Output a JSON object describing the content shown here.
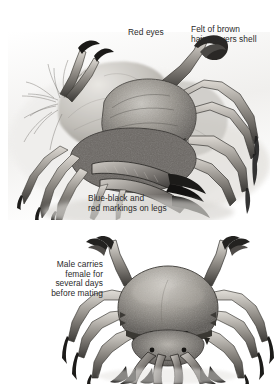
{
  "plate": {
    "title": "Velvet swimming crab anatomy and mating plate",
    "background_color": "#ffffff",
    "text_color": "#2b2b2b",
    "width": 278,
    "height": 385
  },
  "labels": {
    "red_eyes": "Red eyes",
    "felt_of_brown_hairs": "Felt of brown\nhairs covers shell",
    "blue_black_markings": "Blue-black and\nred markings on legs",
    "male_carries_female": "Male carries\nfemale for\nseveral days\nbefore mating"
  },
  "figures": {
    "top": {
      "name": "crab-side-view-on-rocks",
      "description": "Grayscale pencil illustration of a velvet swimming crab in side three-quarter view resting on rock and seaweed, walking legs and chelae extended"
    },
    "bottom": {
      "name": "crab-pair-frontal-view",
      "description": "Grayscale pencil illustration of a male crab carrying a female beneath him, seen from the front with carapace, eyes and claws visible"
    }
  },
  "palette": {
    "ink_dark": "#1f1f1f",
    "ink_mid": "#6f6f6f",
    "ink_light": "#b9b9b9",
    "paper": "#ffffff",
    "shell_tone": "#8d8d8d",
    "shell_highlight": "#d4d4d4"
  }
}
